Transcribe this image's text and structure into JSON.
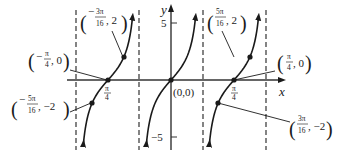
{
  "chart_data": {
    "type": "line",
    "title": "",
    "function": "y = 2 tan(4x)",
    "xlabel": "x",
    "ylabel": "y",
    "x_ticks": [
      {
        "value": "-π/4",
        "label": "π/4",
        "sign": "-"
      },
      {
        "value": "π/4",
        "label": "π/4"
      }
    ],
    "y_ticks": [
      {
        "value": 5,
        "label": "5"
      },
      {
        "value": -5,
        "label": "−5"
      }
    ],
    "asymptotes": [
      "-3π/8",
      "-π/8",
      "π/8",
      "3π/8"
    ],
    "series": [
      {
        "name": "y = 2tan(4x)",
        "points": [
          {
            "x": "-5π/16",
            "y": -2
          },
          {
            "x": "-π/4",
            "y": 0
          },
          {
            "x": "-3π/16",
            "y": 2
          },
          {
            "x": "0",
            "y": 0
          },
          {
            "x": "3π/16",
            "y": -2
          },
          {
            "x": "π/4",
            "y": 0
          },
          {
            "x": "5π/16",
            "y": 2
          }
        ]
      }
    ],
    "annotations": [
      {
        "id": "neg-3pi16",
        "text": "(−3π/16, 2)",
        "num": "3π",
        "den": "16",
        "sign": "−",
        "yval": "2"
      },
      {
        "id": "neg-pi4",
        "text": "(−π/4, 0)",
        "num": "π",
        "den": "4",
        "sign": "−",
        "yval": "0"
      },
      {
        "id": "neg-5pi16",
        "text": "(−5π/16, −2)",
        "num": "5π",
        "den": "16",
        "sign": "−",
        "yval": "−2"
      },
      {
        "id": "origin",
        "text": "(0,0)"
      },
      {
        "id": "pos-5pi16",
        "text": "(5π/16, 2)",
        "num": "5π",
        "den": "16",
        "sign": "",
        "yval": "2"
      },
      {
        "id": "pos-pi4",
        "text": "(π/4, 0)",
        "num": "π",
        "den": "4",
        "sign": "",
        "yval": "0"
      },
      {
        "id": "pos-3pi16",
        "text": "(3π/16, −2)",
        "num": "3π",
        "den": "16",
        "sign": "",
        "yval": "−2"
      }
    ],
    "xlim": [
      "-3π/8",
      "3π/8"
    ],
    "ylim": [
      -6,
      6
    ],
    "grid": false,
    "legend": null
  },
  "labels": {
    "x_axis": "x",
    "y_axis": "y",
    "y_tick_top": "5",
    "y_tick_bottom": "−5",
    "tick_pi": "π",
    "tick_four": "4",
    "origin": "(0,0)",
    "a1": {
      "sign": "−",
      "num": "3π",
      "den": "16",
      "tail": ", 2"
    },
    "a2": {
      "sign": "−",
      "num": "π",
      "den": "4",
      "tail": ", 0"
    },
    "a3": {
      "sign": "−",
      "num": "5π",
      "den": "16",
      "tail": ", −2"
    },
    "a4": {
      "sign": "",
      "num": "5π",
      "den": "16",
      "tail": ", 2"
    },
    "a5": {
      "sign": "",
      "num": "π",
      "den": "4",
      "tail": ", 0"
    },
    "a6": {
      "sign": "",
      "num": "3π",
      "den": "16",
      "tail": ", −2"
    }
  }
}
